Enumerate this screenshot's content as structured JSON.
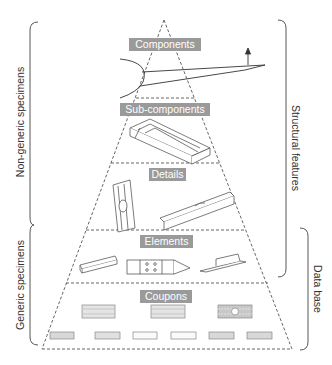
{
  "tiers": [
    {
      "label": "Components",
      "level": 1
    },
    {
      "label": "Sub-components",
      "level": 2
    },
    {
      "label": "Details",
      "level": 3
    },
    {
      "label": "Elements",
      "level": 4
    },
    {
      "label": "Coupons",
      "level": 5
    }
  ],
  "left_braces": {
    "upper": "Non-generic specimens",
    "lower": "Generic specimens"
  },
  "right_braces": {
    "upper": "Structural features",
    "lower": "Data base"
  },
  "colors": {
    "label_bg": "#9a9a9a",
    "label_text": "#ffffff",
    "line": "#444444",
    "coupon_fill": "#d8d8d8"
  }
}
